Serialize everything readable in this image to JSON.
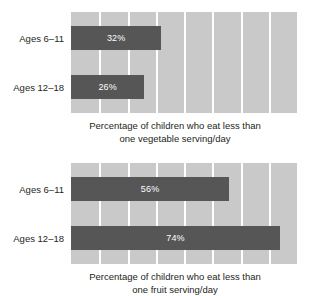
{
  "chart_data": [
    {
      "type": "bar",
      "orientation": "horizontal",
      "title": "",
      "caption_line1": "Percentage of children who eat less than",
      "caption_line2": "one vegetable serving/day",
      "xlabel": "",
      "ylabel": "",
      "categories": [
        "Ages 6–11",
        "Ages 12–18"
      ],
      "values": [
        32,
        26
      ],
      "value_labels": [
        "32%",
        "26%"
      ],
      "xlim": [
        0,
        80
      ],
      "grid": true,
      "grid_interval": 10,
      "legend": "none",
      "bar_color": "#565656",
      "plot_background": "#c9c9c9",
      "gridline_color": "#ffffff",
      "value_label_color": "#ffffff"
    },
    {
      "type": "bar",
      "orientation": "horizontal",
      "title": "",
      "caption_line1": "Percentage of children who eat less than",
      "caption_line2": "one fruit serving/day",
      "xlabel": "",
      "ylabel": "",
      "categories": [
        "Ages 6–11",
        "Ages 12–18"
      ],
      "values": [
        56,
        74
      ],
      "value_labels": [
        "56%",
        "74%"
      ],
      "xlim": [
        0,
        80
      ],
      "grid": true,
      "grid_interval": 10,
      "legend": "none",
      "bar_color": "#565656",
      "plot_background": "#c9c9c9",
      "gridline_color": "#ffffff",
      "value_label_color": "#ffffff"
    }
  ]
}
